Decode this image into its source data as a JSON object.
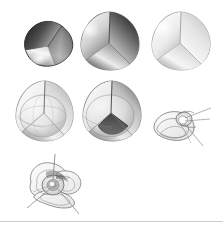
{
  "figure": {
    "background_color": "#ffffff",
    "width": 223,
    "height": 229,
    "baseline_rule": {
      "visible": true,
      "color": "#cfcfcf",
      "x": 0,
      "y": 221,
      "width": 223
    },
    "objects": [
      {
        "id": "obj-1",
        "name": "lens-opaque-dark",
        "label": "",
        "row": 1,
        "column": 1,
        "style": "opaque",
        "shading": "dark",
        "x": 19,
        "y": 18,
        "width": 56,
        "height": 52,
        "rotation_deg": -28,
        "seam_visible": true,
        "fill_light": "#f2f2f2",
        "fill_mid": "#9a9a9a",
        "fill_dark": "#1d1d1d",
        "outline_color": "#2a2a2a"
      },
      {
        "id": "obj-2",
        "name": "rounded-tetrahedron-opaque-shaded",
        "label": "",
        "row": 1,
        "column": 2,
        "style": "opaque",
        "shading": "medium",
        "x": 78,
        "y": 10,
        "width": 64,
        "height": 62,
        "rotation_deg": 0,
        "seam_visible": true,
        "fill_light": "#fbfbfb",
        "fill_mid": "#b4b4b4",
        "fill_dark": "#2e2e2e",
        "outline_color": "#5a5a5a"
      },
      {
        "id": "obj-3",
        "name": "rounded-tetrahedron-opaque-light",
        "label": "",
        "row": 1,
        "column": 3,
        "style": "opaque",
        "shading": "light",
        "x": 150,
        "y": 10,
        "width": 63,
        "height": 62,
        "rotation_deg": 0,
        "seam_visible": true,
        "fill_light": "#ffffff",
        "fill_mid": "#d8d8d8",
        "fill_dark": "#9d9d9d",
        "outline_color": "#8a8a8a"
      },
      {
        "id": "obj-4",
        "name": "rounded-tetrahedron-translucent-inner-sphere",
        "label": "",
        "row": 2,
        "column": 1,
        "style": "translucent",
        "shading": "light",
        "x": 14,
        "y": 79,
        "width": 62,
        "height": 64,
        "rotation_deg": 0,
        "seam_visible": true,
        "inner_surface": "sphere",
        "fill_light": "#ffffff",
        "fill_mid": "#d2d2d2",
        "fill_dark": "#6e6e6e",
        "outline_color": "#7d7d7d"
      },
      {
        "id": "obj-5",
        "name": "rounded-tetrahedron-translucent-inner-cone",
        "label": "",
        "row": 2,
        "column": 2,
        "style": "translucent",
        "shading": "medium",
        "x": 80,
        "y": 79,
        "width": 64,
        "height": 64,
        "rotation_deg": 0,
        "seam_visible": true,
        "inner_surface": "cone",
        "fill_light": "#ffffff",
        "fill_mid": "#c6c6c6",
        "fill_dark": "#3a3a3a",
        "outline_color": "#6f6f6f"
      },
      {
        "id": "obj-6",
        "name": "collapsed-surface-wireframe-tilted",
        "label": "",
        "row": 2,
        "column": 3,
        "style": "wireframe",
        "shading": "outline",
        "x": 151,
        "y": 106,
        "width": 62,
        "height": 42,
        "rotation_deg": -12,
        "seam_visible": true,
        "ray_count": 3,
        "fill_light": "#ffffff",
        "fill_mid": "#ededed",
        "fill_dark": "#b8b8b8",
        "outline_color": "#6b6b6b"
      },
      {
        "id": "obj-7",
        "name": "collapsed-surface-wireframe-pinwheel",
        "label": "",
        "row": 3,
        "column": 1,
        "style": "wireframe",
        "shading": "outline",
        "x": 22,
        "y": 152,
        "width": 70,
        "height": 66,
        "rotation_deg": 0,
        "seam_visible": true,
        "ray_count": 3,
        "fill_light": "#ffffff",
        "fill_mid": "#ebebeb",
        "fill_dark": "#9a9a9a",
        "outline_color": "#6b6b6b"
      }
    ]
  }
}
